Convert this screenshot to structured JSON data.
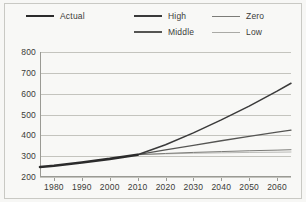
{
  "colors": {
    "background": "#f8f8f6",
    "border": "#c9c9c4",
    "grid": "#c4c4be",
    "axis": "#9a9a94",
    "text": "#3b3b38",
    "actual": "#2b2b2b",
    "high": "#3a3a3a",
    "middle": "#555553",
    "zero": "#7c7c78",
    "low": "#aaaaa6"
  },
  "legend": {
    "columns": [
      {
        "left": 0,
        "entries": [
          {
            "key": "actual",
            "label": "Actual",
            "width": 2.6,
            "color": "#2b2b2b"
          }
        ]
      },
      {
        "left": 108,
        "entries": [
          {
            "key": "high",
            "label": "High",
            "width": 1.5,
            "color": "#3a3a3a"
          },
          {
            "key": "middle",
            "label": "Middle",
            "width": 1.3,
            "color": "#555553"
          }
        ]
      },
      {
        "left": 186,
        "entries": [
          {
            "key": "zero",
            "label": "Zero",
            "width": 1.0,
            "color": "#7c7c78"
          },
          {
            "key": "low",
            "label": "Low",
            "width": 0.8,
            "color": "#aaaaa6"
          }
        ]
      }
    ]
  },
  "chart_data": {
    "type": "line",
    "title": "",
    "subtitle": "",
    "xlabel": "",
    "ylabel": "",
    "xlim": [
      1975,
      2065
    ],
    "ylim": [
      200,
      800
    ],
    "grid": true,
    "legend_position": "top",
    "x_ticks": [
      1980,
      1990,
      2000,
      2010,
      2020,
      2030,
      2040,
      2050,
      2060
    ],
    "y_ticks": [
      200,
      300,
      400,
      500,
      600,
      700,
      800
    ],
    "series": [
      {
        "name": "Actual",
        "color": "#2b2b2b",
        "width": 2.6,
        "x": [
          1975,
          1980,
          1990,
          2000,
          2010
        ],
        "values": [
          248,
          254,
          270,
          287,
          307
        ]
      },
      {
        "name": "High",
        "color": "#3a3a3a",
        "width": 1.5,
        "x": [
          2010,
          2020,
          2030,
          2040,
          2050,
          2060,
          2065
        ],
        "values": [
          307,
          355,
          412,
          474,
          540,
          612,
          650
        ]
      },
      {
        "name": "Middle",
        "color": "#555553",
        "width": 1.3,
        "x": [
          2010,
          2020,
          2030,
          2040,
          2050,
          2060,
          2065
        ],
        "values": [
          307,
          330,
          352,
          374,
          395,
          415,
          425
        ]
      },
      {
        "name": "Zero",
        "color": "#7c7c78",
        "width": 1.0,
        "x": [
          2010,
          2020,
          2030,
          2040,
          2050,
          2060,
          2065
        ],
        "values": [
          307,
          313,
          318,
          322,
          326,
          329,
          331
        ]
      },
      {
        "name": "Low",
        "color": "#aaaaa6",
        "width": 0.8,
        "x": [
          2010,
          2020,
          2030,
          2040,
          2050,
          2060,
          2065
        ],
        "values": [
          307,
          311,
          314,
          316,
          318,
          319,
          320
        ]
      }
    ]
  }
}
